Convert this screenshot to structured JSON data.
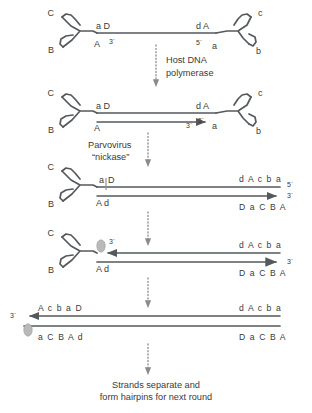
{
  "figure": {
    "caption_line1": "Strands separate and",
    "caption_line2": "form hairpins for next round",
    "colors": {
      "strand": "#55595c",
      "text": "#3a3a3a",
      "dotted_arrow": "#8b8b8b",
      "protein": "#b9b9b9",
      "background": "#ffffff"
    }
  },
  "transitions": [
    {
      "id": "host-dna-polymerase",
      "line1": "Host DNA",
      "line2": "polymerase"
    },
    {
      "id": "parvovirus-nickase",
      "line1": "Parvovirus",
      "line2": "“nickase”"
    },
    {
      "id": "transition-3",
      "line1": "",
      "line2": ""
    },
    {
      "id": "transition-4",
      "line1": "",
      "line2": ""
    },
    {
      "id": "transition-5",
      "line1": "",
      "line2": ""
    }
  ],
  "stages": [
    {
      "id": "stage-1",
      "name": "single-stranded-genome-with-terminal-hairpins",
      "left_hairpin": {
        "arm_top": "C",
        "arm_bottom": "B"
      },
      "right_hairpin": {
        "arm_top": "c",
        "arm_bottom": "b"
      },
      "left_labels": {
        "top": "a D",
        "bottom": "A",
        "prime": "3´"
      },
      "right_labels": {
        "top": "d A",
        "bottom": "a",
        "prime": "5´"
      }
    },
    {
      "id": "stage-2",
      "name": "extended-by-host-dna-polymerase",
      "left_hairpin": {
        "arm_top": "C",
        "arm_bottom": "B"
      },
      "right_hairpin": {
        "arm_top": "c",
        "arm_bottom": "b"
      },
      "left_labels": {
        "top": "a D",
        "bottom": "A",
        "prime": ""
      },
      "right_labels": {
        "top": "d A",
        "bottom": "a",
        "prime": "5´",
        "arrow_prime": "3´"
      }
    },
    {
      "id": "stage-3",
      "name": "nicked-duplex",
      "left_hairpin": {
        "arm_top": "C",
        "arm_bottom": "B"
      },
      "left_labels": {
        "top_before_nick": "a",
        "top_after_nick": "D",
        "bottom": "A d"
      },
      "nick_marker": true,
      "right_labels": {
        "top": "d A c b a",
        "top_prime": "5´",
        "bottom": "D a C B A",
        "arrow_prime": "3´"
      }
    },
    {
      "id": "stage-4",
      "name": "protein-linked-nick-with-new-strand-synthesis",
      "left_hairpin": {
        "arm_top": "C",
        "arm_bottom": "B"
      },
      "left_labels": {
        "prime": "3´",
        "bottom": "A d"
      },
      "protein": true,
      "right_labels": {
        "top": "d A c b a",
        "bottom": "D a C B A",
        "arrow_prime": "3´"
      }
    },
    {
      "id": "stage-5",
      "name": "linear-duplex-extended-form",
      "left_labels": {
        "prime": "3´",
        "top": "A c b a D",
        "bottom": "a C B A d"
      },
      "protein": true,
      "right_labels": {
        "top": "d A c b a",
        "bottom": "D a C B A"
      }
    }
  ]
}
